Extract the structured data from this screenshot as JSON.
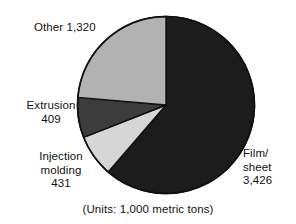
{
  "figure": {
    "caption": "(Units: 1,000 metric tons)"
  },
  "labels": {
    "film_sheet": "Film/\nsheet\n3,426",
    "other": "Other 1,320",
    "extrusion": "Extrusion\n409",
    "injection_molding": "Injection\nmolding\n431"
  },
  "chart_data": {
    "type": "pie",
    "title": "",
    "subtitle": "",
    "caption": "(Units: 1,000 metric tons)",
    "units": "1,000 metric tons",
    "total": 5586,
    "legend": "none (direct labels)",
    "grid": false,
    "start_angle_deg": 0,
    "direction": "clockwise",
    "categories": [
      "Film/sheet",
      "Injection molding",
      "Extrusion",
      "Other"
    ],
    "values": [
      3426,
      431,
      409,
      1320
    ],
    "value_labels": [
      "3,426",
      "431",
      "409",
      "1,320"
    ],
    "percents": [
      61.3,
      7.7,
      7.3,
      23.6
    ],
    "colors": [
      "#1c1c1c",
      "#d6d6d6",
      "#3c3c3c",
      "#b2b2b2"
    ],
    "slices": [
      {
        "name": "Film/sheet",
        "value": 3426,
        "label": "3,426",
        "percent": 61.3,
        "color": "#1c1c1c"
      },
      {
        "name": "Injection molding",
        "value": 431,
        "label": "431",
        "percent": 7.7,
        "color": "#d6d6d6"
      },
      {
        "name": "Extrusion",
        "value": 409,
        "label": "409",
        "percent": 7.3,
        "color": "#3c3c3c"
      },
      {
        "name": "Other",
        "value": 1320,
        "label": "1,320",
        "percent": 23.6,
        "color": "#b2b2b2"
      }
    ]
  }
}
